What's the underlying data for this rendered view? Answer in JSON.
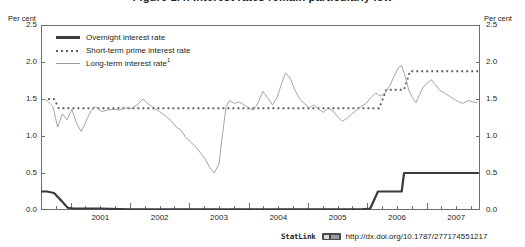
{
  "figure": {
    "title": "Figure 1.4. Interest rates remain particularly low",
    "axis_unit_left": "Per cent",
    "axis_unit_right": "Per cent"
  },
  "legend": {
    "items": [
      {
        "label": "Overnight interest rate",
        "style": "solid-thick",
        "color": "#3b3b3b",
        "icon": "line-swatch-icon"
      },
      {
        "label": "Short-term prime interest rate",
        "style": "dotted",
        "color": "#5b5b5b",
        "icon": "dotted-line-swatch-icon"
      },
      {
        "label": "Long-term interest rate",
        "superscript": "1",
        "style": "solid-thin",
        "color": "#9b9b9b",
        "icon": "thin-line-swatch-icon"
      }
    ]
  },
  "footer": {
    "statlink_label": "StatLink",
    "statlink_icon": "statlink-badge-icon",
    "url": "http://dx.doi.org/10.1787/277174551217"
  },
  "chart_data": {
    "type": "line",
    "title": "Figure 1.4. Interest rates remain particularly low",
    "xlabel": "",
    "ylabel": "Per cent",
    "ylim": [
      0.0,
      2.5
    ],
    "xlim": [
      2000.5,
      2007.9
    ],
    "ytick_labels": [
      "0.0",
      "0.5",
      "1.0",
      "1.5",
      "2.0",
      "2.5"
    ],
    "ytick_values": [
      0.0,
      0.5,
      1.0,
      1.5,
      2.0,
      2.5
    ],
    "xtick_labels": [
      "2001",
      "2002",
      "2003",
      "2004",
      "2005",
      "2006",
      "2007"
    ],
    "xtick_values": [
      2001,
      2002,
      2003,
      2004,
      2005,
      2006,
      2007
    ],
    "grid": false,
    "legend_position": "top-left inside",
    "series": [
      {
        "name": "Overnight interest rate",
        "color": "#3b3b3b",
        "style": "solid-thick",
        "points": [
          [
            2000.5,
            0.25
          ],
          [
            2000.6,
            0.25
          ],
          [
            2000.72,
            0.23
          ],
          [
            2000.85,
            0.12
          ],
          [
            2000.95,
            0.03
          ],
          [
            2001.05,
            0.02
          ],
          [
            2001.5,
            0.02
          ],
          [
            2002.0,
            0.01
          ],
          [
            2002.5,
            0.01
          ],
          [
            2003.0,
            0.01
          ],
          [
            2003.5,
            0.01
          ],
          [
            2004.0,
            0.01
          ],
          [
            2004.5,
            0.01
          ],
          [
            2005.0,
            0.01
          ],
          [
            2005.5,
            0.01
          ],
          [
            2005.9,
            0.01
          ],
          [
            2006.05,
            0.02
          ],
          [
            2006.18,
            0.25
          ],
          [
            2006.3,
            0.25
          ],
          [
            2006.45,
            0.25
          ],
          [
            2006.58,
            0.25
          ],
          [
            2006.62,
            0.5
          ],
          [
            2006.8,
            0.5
          ],
          [
            2007.0,
            0.5
          ],
          [
            2007.3,
            0.5
          ],
          [
            2007.6,
            0.5
          ],
          [
            2007.88,
            0.5
          ]
        ]
      },
      {
        "name": "Short-term prime interest rate",
        "color": "#5b5b5b",
        "style": "dotted",
        "points": [
          [
            2000.62,
            1.5
          ],
          [
            2000.72,
            1.5
          ],
          [
            2000.8,
            1.375
          ],
          [
            2001.0,
            1.375
          ],
          [
            2001.5,
            1.375
          ],
          [
            2002.0,
            1.375
          ],
          [
            2002.5,
            1.375
          ],
          [
            2003.0,
            1.375
          ],
          [
            2003.5,
            1.375
          ],
          [
            2004.0,
            1.375
          ],
          [
            2004.5,
            1.375
          ],
          [
            2005.0,
            1.375
          ],
          [
            2005.5,
            1.375
          ],
          [
            2006.0,
            1.375
          ],
          [
            2006.2,
            1.375
          ],
          [
            2006.32,
            1.625
          ],
          [
            2006.5,
            1.625
          ],
          [
            2006.62,
            1.625
          ],
          [
            2006.72,
            1.875
          ],
          [
            2007.0,
            1.875
          ],
          [
            2007.3,
            1.875
          ],
          [
            2007.6,
            1.875
          ],
          [
            2007.88,
            1.875
          ]
        ]
      },
      {
        "name": "Long-term interest rate",
        "color": "#9b9b9b",
        "style": "solid-thin",
        "points": [
          [
            2000.52,
            1.5
          ],
          [
            2000.6,
            1.48
          ],
          [
            2000.7,
            1.4
          ],
          [
            2000.78,
            1.12
          ],
          [
            2000.86,
            1.3
          ],
          [
            2000.94,
            1.22
          ],
          [
            2001.02,
            1.36
          ],
          [
            2001.1,
            1.17
          ],
          [
            2001.18,
            1.06
          ],
          [
            2001.26,
            1.2
          ],
          [
            2001.34,
            1.34
          ],
          [
            2001.42,
            1.4
          ],
          [
            2001.52,
            1.33
          ],
          [
            2001.62,
            1.35
          ],
          [
            2001.72,
            1.36
          ],
          [
            2001.82,
            1.35
          ],
          [
            2001.92,
            1.38
          ],
          [
            2002.02,
            1.37
          ],
          [
            2002.12,
            1.42
          ],
          [
            2002.22,
            1.5
          ],
          [
            2002.3,
            1.44
          ],
          [
            2002.4,
            1.38
          ],
          [
            2002.5,
            1.33
          ],
          [
            2002.6,
            1.27
          ],
          [
            2002.7,
            1.2
          ],
          [
            2002.78,
            1.12
          ],
          [
            2002.86,
            1.08
          ],
          [
            2002.94,
            0.98
          ],
          [
            2003.02,
            0.92
          ],
          [
            2003.1,
            0.86
          ],
          [
            2003.18,
            0.78
          ],
          [
            2003.26,
            0.7
          ],
          [
            2003.34,
            0.58
          ],
          [
            2003.42,
            0.5
          ],
          [
            2003.5,
            0.62
          ],
          [
            2003.56,
            1.02
          ],
          [
            2003.62,
            1.4
          ],
          [
            2003.68,
            1.48
          ],
          [
            2003.76,
            1.44
          ],
          [
            2003.84,
            1.46
          ],
          [
            2003.92,
            1.42
          ],
          [
            2004.0,
            1.38
          ],
          [
            2004.08,
            1.35
          ],
          [
            2004.16,
            1.45
          ],
          [
            2004.24,
            1.6
          ],
          [
            2004.32,
            1.52
          ],
          [
            2004.4,
            1.42
          ],
          [
            2004.48,
            1.52
          ],
          [
            2004.56,
            1.72
          ],
          [
            2004.62,
            1.85
          ],
          [
            2004.7,
            1.78
          ],
          [
            2004.78,
            1.62
          ],
          [
            2004.86,
            1.5
          ],
          [
            2004.94,
            1.44
          ],
          [
            2005.02,
            1.38
          ],
          [
            2005.1,
            1.42
          ],
          [
            2005.18,
            1.36
          ],
          [
            2005.26,
            1.32
          ],
          [
            2005.34,
            1.38
          ],
          [
            2005.42,
            1.34
          ],
          [
            2005.5,
            1.26
          ],
          [
            2005.58,
            1.2
          ],
          [
            2005.66,
            1.24
          ],
          [
            2005.74,
            1.3
          ],
          [
            2005.82,
            1.35
          ],
          [
            2005.9,
            1.4
          ],
          [
            2005.98,
            1.44
          ],
          [
            2006.06,
            1.52
          ],
          [
            2006.14,
            1.58
          ],
          [
            2006.22,
            1.54
          ],
          [
            2006.3,
            1.58
          ],
          [
            2006.38,
            1.68
          ],
          [
            2006.46,
            1.82
          ],
          [
            2006.52,
            1.92
          ],
          [
            2006.58,
            1.95
          ],
          [
            2006.64,
            1.8
          ],
          [
            2006.7,
            1.62
          ],
          [
            2006.76,
            1.52
          ],
          [
            2006.82,
            1.45
          ],
          [
            2006.88,
            1.56
          ],
          [
            2006.94,
            1.66
          ],
          [
            2007.02,
            1.72
          ],
          [
            2007.08,
            1.76
          ],
          [
            2007.14,
            1.7
          ],
          [
            2007.22,
            1.62
          ],
          [
            2007.3,
            1.58
          ],
          [
            2007.38,
            1.54
          ],
          [
            2007.46,
            1.5
          ],
          [
            2007.54,
            1.46
          ],
          [
            2007.62,
            1.44
          ],
          [
            2007.7,
            1.48
          ],
          [
            2007.78,
            1.46
          ],
          [
            2007.86,
            1.45
          ]
        ]
      }
    ]
  }
}
